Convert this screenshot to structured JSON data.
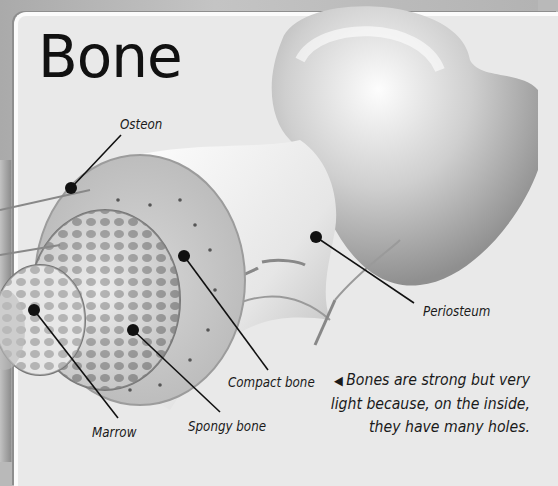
{
  "title": "Bone",
  "labels": {
    "osteon": "Osteon",
    "compact_bone": "Compact bone",
    "spongy_bone": "Spongy bone",
    "marrow": "Marrow",
    "periosteum": "Periosteum"
  },
  "caption": {
    "arrow": "◀",
    "line1": "Bones are strong but very",
    "line2": "light because, on the inside,",
    "line3": "they have many holes."
  },
  "colors": {
    "panel": "#e9e9e9",
    "ink": "#111111",
    "bone_light": "#f4f4f4",
    "bone_shade": "#a8a8a8"
  }
}
